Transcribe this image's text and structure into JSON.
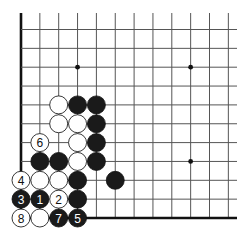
{
  "diagram": {
    "type": "go-board-fragment",
    "visible_columns": 12,
    "visible_rows": 11,
    "edges": [
      "left",
      "bottom"
    ],
    "hoshi": [
      {
        "col": 3,
        "row": 2
      },
      {
        "col": 9,
        "row": 2
      },
      {
        "col": 9,
        "row": 7
      }
    ],
    "stones": [
      {
        "col": 2,
        "row": 4,
        "color": "white",
        "label": ""
      },
      {
        "col": 3,
        "row": 4,
        "color": "black",
        "label": ""
      },
      {
        "col": 4,
        "row": 4,
        "color": "black",
        "label": ""
      },
      {
        "col": 2,
        "row": 5,
        "color": "white",
        "label": ""
      },
      {
        "col": 3,
        "row": 5,
        "color": "white",
        "label": ""
      },
      {
        "col": 4,
        "row": 5,
        "color": "black",
        "label": ""
      },
      {
        "col": 1,
        "row": 6,
        "color": "white",
        "label": "6"
      },
      {
        "col": 3,
        "row": 6,
        "color": "white",
        "label": ""
      },
      {
        "col": 4,
        "row": 6,
        "color": "black",
        "label": ""
      },
      {
        "col": 1,
        "row": 7,
        "color": "black",
        "label": ""
      },
      {
        "col": 2,
        "row": 7,
        "color": "black",
        "label": ""
      },
      {
        "col": 3,
        "row": 7,
        "color": "white",
        "label": ""
      },
      {
        "col": 4,
        "row": 7,
        "color": "black",
        "label": ""
      },
      {
        "col": 0,
        "row": 8,
        "color": "white",
        "label": "4"
      },
      {
        "col": 1,
        "row": 8,
        "color": "white",
        "label": ""
      },
      {
        "col": 2,
        "row": 8,
        "color": "white",
        "label": ""
      },
      {
        "col": 3,
        "row": 8,
        "color": "black",
        "label": ""
      },
      {
        "col": 5,
        "row": 8,
        "color": "black",
        "label": ""
      },
      {
        "col": 0,
        "row": 9,
        "color": "black",
        "label": "3"
      },
      {
        "col": 1,
        "row": 9,
        "color": "black",
        "label": "1"
      },
      {
        "col": 2,
        "row": 9,
        "color": "white",
        "label": "2"
      },
      {
        "col": 3,
        "row": 9,
        "color": "black",
        "label": ""
      },
      {
        "col": 0,
        "row": 10,
        "color": "white",
        "label": "8"
      },
      {
        "col": 1,
        "row": 10,
        "color": "white",
        "label": ""
      },
      {
        "col": 2,
        "row": 10,
        "color": "black",
        "label": "7"
      },
      {
        "col": 3,
        "row": 10,
        "color": "black",
        "label": "5"
      }
    ]
  }
}
